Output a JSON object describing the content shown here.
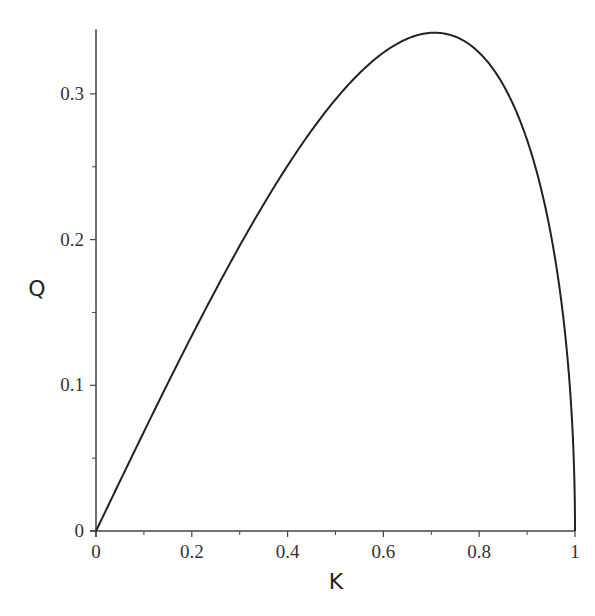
{
  "chart_data": {
    "type": "line",
    "title": "",
    "xlabel": "K",
    "ylabel": "Q",
    "xlim": [
      0,
      1
    ],
    "ylim": [
      0,
      0.343
    ],
    "grid": false,
    "legend": null,
    "x_ticks": [
      {
        "value": 0,
        "label": "0"
      },
      {
        "value": 0.2,
        "label": "0.2"
      },
      {
        "value": 0.4,
        "label": "0.4"
      },
      {
        "value": 0.6,
        "label": "0.6"
      },
      {
        "value": 0.8,
        "label": "0.8"
      },
      {
        "value": 1,
        "label": "1"
      }
    ],
    "x_minor_ticks": [
      0.1,
      0.3,
      0.5,
      0.7,
      0.9
    ],
    "y_ticks": [
      {
        "value": 0,
        "label": "0"
      },
      {
        "value": 0.1,
        "label": "0.1"
      },
      {
        "value": 0.2,
        "label": "0.2"
      },
      {
        "value": 0.3,
        "label": "0.3"
      }
    ],
    "y_minor_ticks": [
      0.05,
      0.15,
      0.25
    ],
    "series": [
      {
        "name": "Q(K)",
        "color": "#222222",
        "x": [
          0,
          0.05,
          0.1,
          0.15,
          0.2,
          0.25,
          0.3,
          0.35,
          0.4,
          0.45,
          0.5,
          0.55,
          0.6,
          0.65,
          0.7,
          0.75,
          0.8,
          0.85,
          0.9,
          0.95,
          0.97,
          0.99,
          0.998,
          1.0
        ],
        "y": [
          0,
          0.0342,
          0.0681,
          0.1014,
          0.134,
          0.1656,
          0.1957,
          0.2243,
          0.2508,
          0.2749,
          0.2962,
          0.3142,
          0.3283,
          0.3379,
          0.3419,
          0.3393,
          0.3283,
          0.3063,
          0.2683,
          0.2029,
          0.1613,
          0.0955,
          0.0432,
          0
        ]
      }
    ]
  }
}
